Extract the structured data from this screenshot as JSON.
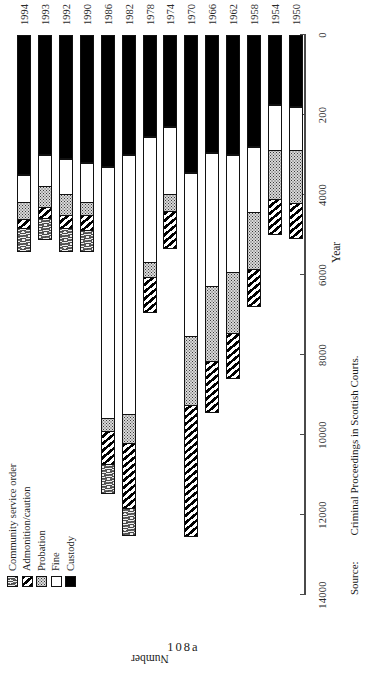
{
  "figure": {
    "folio": "108a",
    "source_key": "Source:",
    "source_value": "Criminal Proceedings in Scottish Courts.",
    "xlabel": "Year",
    "ylabel": "Number"
  },
  "legend": {
    "items": [
      {
        "label": "Community service order",
        "key": "cso",
        "swatch": "scribble-swatch"
      },
      {
        "label": "Admonition/caution",
        "key": "admonition",
        "swatch": "diagonal-hatch-swatch"
      },
      {
        "label": "Probation",
        "key": "probation",
        "swatch": "dotted-swatch"
      },
      {
        "label": "Fine",
        "key": "fine",
        "swatch": "white-swatch"
      },
      {
        "label": "Custody",
        "key": "custody",
        "swatch": "black-swatch"
      }
    ]
  },
  "chart_data": {
    "type": "bar",
    "orientation": "horizontal-rotated",
    "stacked": true,
    "title": "",
    "xlabel": "Year",
    "ylabel": "Number",
    "grid": false,
    "legend_position": "top-left",
    "axis_tick_labels": [
      "14000",
      "12000",
      "10000",
      "8000",
      "6000",
      "4000",
      "200",
      "0"
    ],
    "axis_tick_values": [
      14000,
      12000,
      10000,
      8000,
      6000,
      4000,
      2000,
      0
    ],
    "ylim": [
      0,
      14000
    ],
    "categories": [
      "1950",
      "1954",
      "1958",
      "1962",
      "1966",
      "1970",
      "1974",
      "1978",
      "1982",
      "1986",
      "1990",
      "1992",
      "1993",
      "1994"
    ],
    "series": [
      {
        "name": "Custody",
        "key": "custody",
        "values": [
          1800,
          1750,
          2800,
          3000,
          2950,
          3450,
          2300,
          2550,
          3000,
          3300,
          3200,
          3100,
          3000,
          3500
        ]
      },
      {
        "name": "Fine",
        "key": "fine",
        "values": [
          1100,
          1150,
          1650,
          2950,
          3350,
          4100,
          1700,
          3150,
          6500,
          6300,
          1000,
          900,
          800,
          700
        ]
      },
      {
        "name": "Probation",
        "key": "probation",
        "values": [
          1350,
          1250,
          1450,
          1550,
          1900,
          1750,
          450,
          400,
          750,
          350,
          350,
          550,
          550,
          450
        ]
      },
      {
        "name": "Admonition/caution",
        "key": "admonition",
        "values": [
          900,
          900,
          950,
          1150,
          1300,
          3300,
          950,
          900,
          1650,
          850,
          400,
          350,
          300,
          250
        ]
      },
      {
        "name": "Community service order",
        "key": "cso",
        "values": [
          0,
          0,
          0,
          0,
          0,
          0,
          0,
          0,
          700,
          750,
          550,
          600,
          550,
          600
        ]
      }
    ]
  }
}
